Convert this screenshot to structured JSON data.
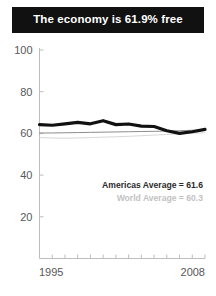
{
  "header": {
    "title": "The economy is 61.9% free",
    "background_color": "#111111",
    "text_color": "#ffffff"
  },
  "legend": {
    "americas_label": "Americas Average = 61.6",
    "world_label": "World Average = 60.3",
    "americas_color": "#2b2b2b",
    "world_color": "#c2c2c2"
  },
  "chart_data": {
    "type": "line",
    "title": "The economy is 61.9% free",
    "xlabel": "",
    "ylabel": "",
    "xlim": [
      1995,
      2008
    ],
    "ylim": [
      0,
      100
    ],
    "yticks": [
      20,
      40,
      60,
      80,
      100
    ],
    "xticks": [
      1995,
      1996,
      1997,
      1998,
      1999,
      2000,
      2001,
      2002,
      2003,
      2004,
      2005,
      2006,
      2007,
      2008
    ],
    "xtick_labels_shown": [
      "1995",
      "2008"
    ],
    "grid": false,
    "legend_position": "inside-lower-right",
    "x": [
      1995,
      1996,
      1997,
      1998,
      1999,
      2000,
      2001,
      2002,
      2003,
      2004,
      2005,
      2006,
      2007,
      2008
    ],
    "series": [
      {
        "name": "Country",
        "color": "#111111",
        "width": 3.2,
        "values": [
          64.2,
          63.9,
          64.6,
          65.3,
          64.6,
          66.1,
          64.2,
          64.5,
          63.5,
          63.3,
          61.3,
          60.0,
          60.8,
          61.9
        ]
      },
      {
        "name": "Americas Average",
        "color": "#8c8c8c",
        "width": 1.0,
        "values": [
          60.2,
          60.2,
          60.3,
          60.4,
          60.5,
          60.6,
          60.7,
          60.8,
          60.9,
          61.0,
          61.1,
          61.3,
          61.5,
          61.6
        ]
      },
      {
        "name": "World Average",
        "color": "#d8d8d8",
        "width": 1.0,
        "values": [
          58.0,
          57.8,
          57.7,
          57.8,
          58.0,
          58.2,
          58.4,
          58.6,
          58.9,
          59.2,
          59.5,
          59.8,
          60.1,
          60.3
        ]
      }
    ],
    "final_values": {
      "country": 61.9,
      "americas_average": 61.6,
      "world_average": 60.3
    }
  },
  "axis": {
    "y_labels": [
      "100",
      "80",
      "60",
      "40",
      "20"
    ],
    "x_label_start": "1995",
    "x_label_end": "2008",
    "axis_color": "#bdbdbd",
    "tick_text_color": "#575757"
  }
}
